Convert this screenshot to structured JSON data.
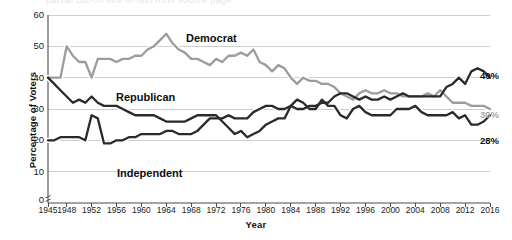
{
  "figure": {
    "top_cropped_text": "partial cut-off line of text from source page",
    "axis": {
      "ylabel": "Percentage of Voters",
      "xlabel": "Year",
      "yticks": [
        0,
        10,
        20,
        30,
        40,
        50,
        60
      ],
      "ylim": [
        0,
        60
      ],
      "xlim": [
        1945,
        2016
      ]
    },
    "annotations": {
      "democrat": "Democrat",
      "republican": "Republican",
      "independent": "Independent"
    },
    "end_labels": {
      "independent": "40%",
      "democrat": "30%",
      "republican": "28%"
    },
    "colors": {
      "democrat": "#9c9c9c",
      "republican": "#2a2a2a",
      "independent": "#2a2a2a",
      "halo": "#ffffff",
      "grid": "#c9c9c9",
      "axis": "#4a4a4a",
      "text": "#111111",
      "gray_label": "#a6a6a6"
    }
  },
  "chart_data": {
    "type": "line",
    "title": "",
    "subtitle": "",
    "xlabel": "Year",
    "ylabel": "Percentage of Voters",
    "ylim": [
      0,
      60
    ],
    "xlim": [
      1945,
      2016
    ],
    "grid": "horizontal",
    "legend": "inline-annotations",
    "ytick_labels": [
      "0",
      "10",
      "20",
      "30",
      "40",
      "50",
      "60"
    ],
    "xtick_labels": [
      "1945",
      "1948",
      "1952",
      "1956",
      "1960",
      "1964",
      "1968",
      "1972",
      "1976",
      "1980",
      "1984",
      "1988",
      "1992",
      "1996",
      "2000",
      "2004",
      "2008",
      "2012",
      "2016"
    ],
    "x": [
      1945,
      1946,
      1947,
      1948,
      1949,
      1950,
      1951,
      1952,
      1953,
      1954,
      1955,
      1956,
      1957,
      1958,
      1959,
      1960,
      1961,
      1962,
      1963,
      1964,
      1965,
      1966,
      1967,
      1968,
      1969,
      1970,
      1971,
      1972,
      1973,
      1974,
      1975,
      1976,
      1977,
      1978,
      1979,
      1980,
      1981,
      1982,
      1983,
      1984,
      1985,
      1986,
      1987,
      1988,
      1989,
      1990,
      1991,
      1992,
      1993,
      1994,
      1995,
      1996,
      1997,
      1998,
      1999,
      2000,
      2001,
      2002,
      2003,
      2004,
      2005,
      2006,
      2007,
      2008,
      2009,
      2010,
      2011,
      2012,
      2013,
      2014,
      2015,
      2016
    ],
    "series": [
      {
        "name": "Democrat",
        "color": "#9c9c9c",
        "end_label": "30%",
        "values": [
          40,
          40,
          40,
          50,
          47,
          45,
          45,
          40,
          46,
          46,
          46,
          45,
          46,
          46,
          47,
          47,
          49,
          50,
          52,
          54,
          51,
          49,
          48,
          46,
          46,
          45,
          44,
          46,
          45,
          47,
          47,
          48,
          47,
          49,
          45,
          44,
          42,
          44,
          43,
          40,
          38,
          40,
          39,
          39,
          38,
          38,
          37,
          35,
          34,
          33,
          35,
          36,
          35,
          35,
          36,
          35,
          35,
          34,
          34,
          34,
          34,
          35,
          34,
          36,
          34,
          32,
          32,
          32,
          31,
          31,
          31,
          30
        ]
      },
      {
        "name": "Republican",
        "color": "#2a2a2a",
        "end_label": "28%",
        "values": [
          40,
          38,
          36,
          34,
          32,
          33,
          32,
          34,
          32,
          31,
          31,
          31,
          30,
          29,
          28,
          28,
          28,
          28,
          27,
          26,
          26,
          26,
          26,
          27,
          28,
          28,
          28,
          28,
          26,
          24,
          22,
          23,
          21,
          22,
          23,
          25,
          26,
          27,
          27,
          31,
          33,
          32,
          30,
          30,
          33,
          31,
          31,
          28,
          27,
          30,
          31,
          29,
          28,
          28,
          28,
          28,
          30,
          30,
          30,
          31,
          29,
          28,
          28,
          28,
          28,
          29,
          27,
          28,
          25,
          25,
          26,
          28
        ]
      },
      {
        "name": "Independent",
        "color": "#2a2a2a",
        "end_label": "40%",
        "values": [
          20,
          20,
          21,
          21,
          21,
          21,
          20,
          28,
          27,
          19,
          19,
          20,
          20,
          21,
          21,
          22,
          22,
          22,
          22,
          23,
          23,
          22,
          22,
          22,
          23,
          25,
          27,
          27,
          27,
          28,
          27,
          27,
          27,
          29,
          30,
          31,
          31,
          30,
          30,
          31,
          30,
          30,
          31,
          31,
          32,
          32,
          34,
          35,
          35,
          34,
          33,
          34,
          33,
          33,
          34,
          33,
          34,
          35,
          34,
          34,
          34,
          34,
          34,
          34,
          37,
          38,
          40,
          38,
          42,
          43,
          42,
          40
        ]
      }
    ]
  }
}
